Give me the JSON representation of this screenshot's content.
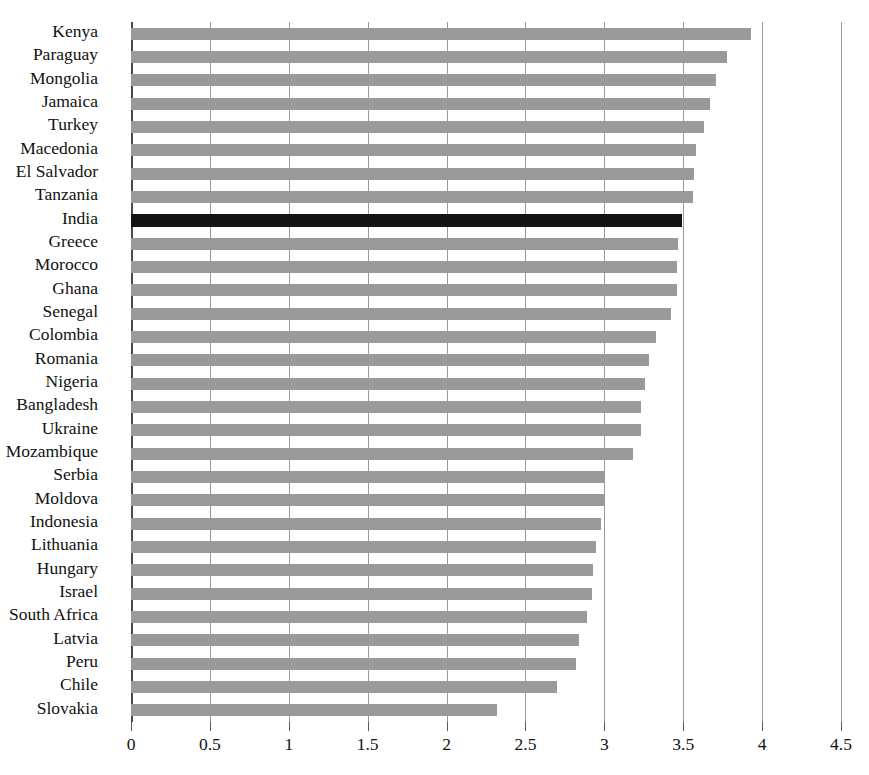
{
  "chart_data": {
    "type": "bar",
    "orientation": "horizontal",
    "title": "",
    "subtitle": "",
    "xlabel": "",
    "ylabel": "",
    "xlim": [
      0,
      4.5
    ],
    "xticks": [
      "0",
      "0.5",
      "1",
      "1.5",
      "2",
      "2.5",
      "3",
      "3.5",
      "4",
      "4.5"
    ],
    "xtick_values": [
      0,
      0.5,
      1,
      1.5,
      2,
      2.5,
      3,
      3.5,
      4,
      4.5
    ],
    "grid": true,
    "grid_axis": "x",
    "legend": false,
    "legend_position": "none",
    "highlight_category": "India",
    "colors": {
      "bar": "#9a9a9a",
      "highlight_bar": "#141414",
      "gridline": "#9b9b9b",
      "axis": "#4a4a4a",
      "background": "#ffffff",
      "text": "#111111"
    },
    "categories": [
      "Kenya",
      "Paraguay",
      "Mongolia",
      "Jamaica",
      "Turkey",
      "Macedonia",
      "El Salvador",
      "Tanzania",
      "India",
      "Greece",
      "Morocco",
      "Ghana",
      "Senegal",
      "Colombia",
      "Romania",
      "Nigeria",
      "Bangladesh",
      "Ukraine",
      "Mozambique",
      "Serbia",
      "Moldova",
      "Indonesia",
      "Lithuania",
      "Hungary",
      "Israel",
      "South Africa",
      "Latvia",
      "Peru",
      "Chile",
      "Slovakia"
    ],
    "values": [
      3.93,
      3.78,
      3.71,
      3.67,
      3.63,
      3.58,
      3.57,
      3.56,
      3.49,
      3.47,
      3.46,
      3.46,
      3.42,
      3.33,
      3.28,
      3.26,
      3.23,
      3.23,
      3.18,
      3.0,
      3.0,
      2.98,
      2.95,
      2.93,
      2.92,
      2.89,
      2.84,
      2.82,
      2.7,
      2.32
    ]
  }
}
